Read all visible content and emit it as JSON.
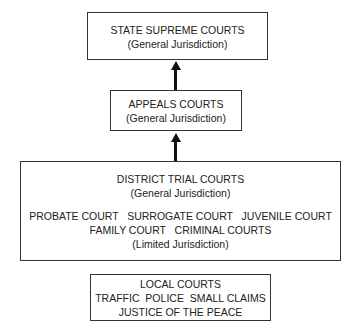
{
  "boxes": {
    "supreme": {
      "title": "STATE SUPREME COURTS",
      "jurisdiction": "(General Jurisdiction)"
    },
    "appeals": {
      "title": "APPEALS COURTS",
      "jurisdiction": "(General Jurisdiction)"
    },
    "district": {
      "title": "DISTRICT TRIAL COURTS",
      "jurisdiction": "(General Jurisdiction)",
      "limited_row1": "PROBATE COURT   SURROGATE COURT   JUVENILE COURT",
      "limited_row2": "FAMILY COURT   CRIMINAL COURTS",
      "limited_jurisdiction": "(Limited Jurisdiction)"
    },
    "local": {
      "title": "LOCAL COURTS",
      "types": "TRAFFIC  POLICE  SMALL CLAIMS",
      "justice": "JUSTICE OF THE PEACE"
    }
  },
  "arrows": [
    {
      "from": "appeals",
      "to": "supreme"
    },
    {
      "from": "district",
      "to": "appeals"
    }
  ]
}
